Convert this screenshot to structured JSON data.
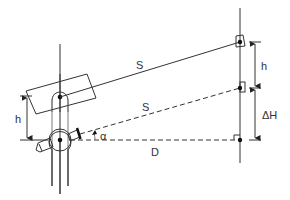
{
  "diagram": {
    "labels": {
      "slope_distance_upper": "S",
      "slope_distance_lower": "S",
      "horizontal_distance": "D",
      "height_right": "h",
      "height_difference": "ΔH",
      "height_left": "h",
      "vertical_angle": "α"
    },
    "colors": {
      "line": "#333333",
      "background": "#ffffff"
    }
  }
}
